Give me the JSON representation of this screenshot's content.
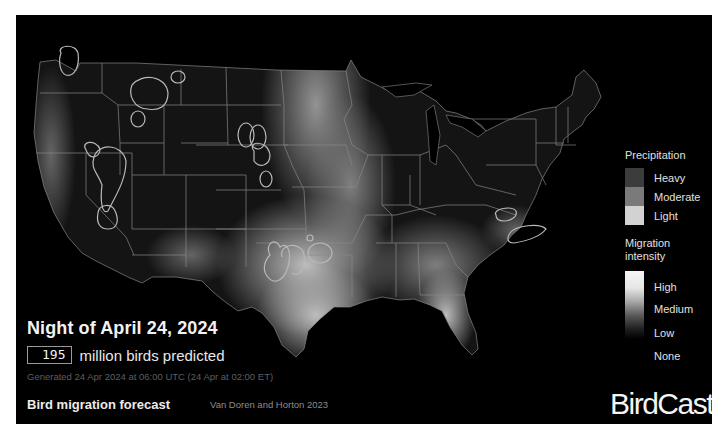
{
  "map": {
    "name": "Contiguous United States bird migration intensity map",
    "background_color": "#000000",
    "state_border_color": "#8a8a8a",
    "precip_outline_color": "#b8b8b8"
  },
  "header": {
    "night_title": "Night of April 24, 2024",
    "birds_count": "195",
    "birds_label": "million birds predicted",
    "generated": "Generated 24 Apr 2024 at 06:00 UTC (24 Apr at 02:00 ET)"
  },
  "footer": {
    "title": "Bird migration forecast",
    "credit": "Van Doren and Horton 2023",
    "logo": "BirdCast"
  },
  "legend": {
    "precipitation": {
      "title": "Precipitation",
      "items": [
        {
          "label": "Heavy",
          "color": "#3c3c3c"
        },
        {
          "label": "Moderate",
          "color": "#7a7a7a"
        },
        {
          "label": "Light",
          "color": "#d2d2d2"
        }
      ]
    },
    "migration": {
      "title_line1": "Migration",
      "title_line2": "intensity",
      "levels": [
        "High",
        "Medium",
        "Low",
        "None"
      ],
      "gradient": [
        "#f5f5f5",
        "#c8c8c8",
        "#7a7a7a",
        "#2a2a2a",
        "#000000"
      ]
    }
  }
}
